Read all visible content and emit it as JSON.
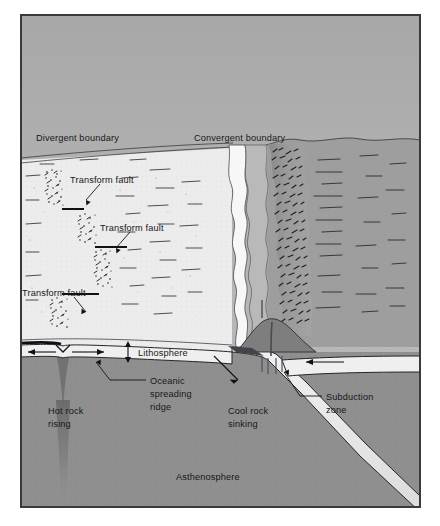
{
  "figure": {
    "frame_border_color": "#3a3a3a",
    "background_color": "#ffffff"
  },
  "palette": {
    "sky": "#b6b6b6",
    "sky_top": "#a9a9a9",
    "ocean_floor": "#ececec",
    "trench": "#f4f4f4",
    "coastal_shelf": "#b4b4b4",
    "mountains": "#8e8e8e",
    "continent": "#9c9c9c",
    "asthenosphere": "#8f8f8f",
    "asthenosphere_deep": "#858585",
    "lithosphere": "#eeeeee",
    "slab": "#e9e9e9",
    "magma_plume": "#6f6f6f",
    "ink": "#17171c"
  },
  "labels": {
    "divergent_boundary": "Divergent boundary",
    "convergent_boundary": "Convergent boundary",
    "transform_fault_1": "Transform fault",
    "transform_fault_2": "Transform fault",
    "transform_fault_3": "Transform fault",
    "lithosphere": "Lithosphere",
    "oceanic_spreading_ridge_line1": "Oceanic",
    "oceanic_spreading_ridge_line2": "spreading",
    "oceanic_spreading_ridge_line3": "ridge",
    "subduction_zone_line1": "Subduction",
    "subduction_zone_line2": "zone",
    "hot_rock_rising_line1": "Hot rock",
    "hot_rock_rising_line2": "rising",
    "cool_rock_sinking_line1": "Cool rock",
    "cool_rock_sinking_line2": "sinking",
    "asthenosphere": "Asthenosphere"
  },
  "diagram_data": {
    "type": "cross-section",
    "features": [
      {
        "name": "divergent-boundary",
        "kind": "plate-boundary",
        "side": "left"
      },
      {
        "name": "convergent-boundary",
        "kind": "plate-boundary",
        "side": "right"
      },
      {
        "name": "transform-fault",
        "kind": "fault",
        "count": 3
      },
      {
        "name": "oceanic-spreading-ridge",
        "kind": "ridge"
      },
      {
        "name": "subduction-zone",
        "kind": "subduction"
      },
      {
        "name": "lithosphere",
        "kind": "layer"
      },
      {
        "name": "asthenosphere",
        "kind": "layer"
      },
      {
        "name": "hot-rock-rising",
        "kind": "convection",
        "direction": "up"
      },
      {
        "name": "cool-rock-sinking",
        "kind": "convection",
        "direction": "down"
      }
    ],
    "arrows": [
      {
        "name": "spreading-left",
        "direction": "left"
      },
      {
        "name": "spreading-right",
        "direction": "right"
      },
      {
        "name": "lithosphere-thickness",
        "direction": "vertical-double"
      },
      {
        "name": "slab-descending",
        "direction": "down-right"
      },
      {
        "name": "overriding-plate",
        "direction": "left"
      }
    ]
  }
}
